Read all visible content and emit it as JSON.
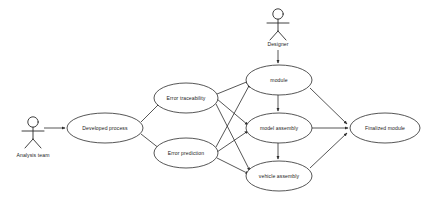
{
  "diagram": {
    "type": "uml-use-case-diagram",
    "title": "",
    "background_color": "#ffffff",
    "stroke_color": "#2b2b2b",
    "text_color": "#1a1a1a",
    "actors": [
      {
        "id": "analysis-team",
        "label": "Analysis team",
        "x": 33,
        "y": 130,
        "label_x": 33,
        "label_y": 155
      },
      {
        "id": "designer",
        "label": "Designer",
        "x": 278,
        "y": 22,
        "label_x": 278,
        "label_y": 45
      }
    ],
    "use_cases": [
      {
        "id": "developed-process",
        "label": "Developed process",
        "cx": 105,
        "cy": 128,
        "rx": 38,
        "ry": 15
      },
      {
        "id": "error-traceability",
        "label": "Error traceability",
        "cx": 186,
        "cy": 98,
        "rx": 32,
        "ry": 15
      },
      {
        "id": "error-prediction",
        "label": "Error prediction",
        "cx": 186,
        "cy": 153,
        "rx": 32,
        "ry": 15
      },
      {
        "id": "module",
        "label": "module",
        "cx": 279,
        "cy": 80,
        "rx": 33,
        "ry": 15
      },
      {
        "id": "model-assembly",
        "label": "model assembly",
        "cx": 279,
        "cy": 128,
        "rx": 33,
        "ry": 15
      },
      {
        "id": "vehicle-assembly",
        "label": "vehicle assembly",
        "cx": 279,
        "cy": 176,
        "rx": 33,
        "ry": 15
      },
      {
        "id": "finalized-module",
        "label": "Finalized module",
        "cx": 385,
        "cy": 128,
        "rx": 35,
        "ry": 15
      }
    ],
    "edges": [
      {
        "from": "analysis-team",
        "to": "developed-process",
        "arrow": true
      },
      {
        "from": "developed-process",
        "to": "error-traceability",
        "arrow": true
      },
      {
        "from": "developed-process",
        "to": "error-prediction",
        "arrow": true
      },
      {
        "from": "error-traceability",
        "to": "module",
        "arrow": true
      },
      {
        "from": "error-traceability",
        "to": "model-assembly",
        "arrow": true
      },
      {
        "from": "error-traceability",
        "to": "vehicle-assembly",
        "arrow": true
      },
      {
        "from": "error-prediction",
        "to": "module",
        "arrow": true
      },
      {
        "from": "error-prediction",
        "to": "model-assembly",
        "arrow": true
      },
      {
        "from": "error-prediction",
        "to": "vehicle-assembly",
        "arrow": true
      },
      {
        "from": "designer",
        "to": "module",
        "arrow": true
      },
      {
        "from": "module",
        "to": "model-assembly",
        "arrow": true
      },
      {
        "from": "model-assembly",
        "to": "vehicle-assembly",
        "arrow": true
      },
      {
        "from": "module",
        "to": "finalized-module",
        "arrow": true
      },
      {
        "from": "model-assembly",
        "to": "finalized-module",
        "arrow": true
      },
      {
        "from": "vehicle-assembly",
        "to": "finalized-module",
        "arrow": true
      }
    ]
  }
}
